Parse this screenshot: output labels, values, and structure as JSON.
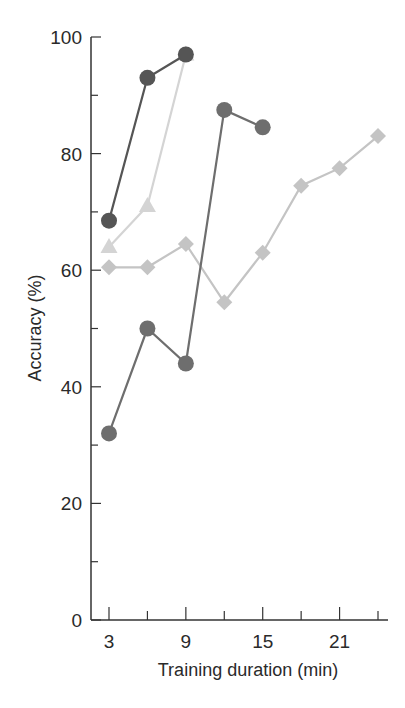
{
  "chart_data": {
    "type": "line",
    "title": "",
    "xlabel": "Training duration (min)",
    "ylabel": "Accuracy (%)",
    "xlim": [
      2,
      25
    ],
    "ylim": [
      0,
      100
    ],
    "x_ticks": [
      3,
      6,
      9,
      12,
      15,
      18,
      21,
      24
    ],
    "x_tick_labels": [
      "3",
      "",
      "9",
      "",
      "15",
      "",
      "21",
      ""
    ],
    "y_ticks": [
      0,
      10,
      20,
      30,
      40,
      50,
      60,
      70,
      80,
      90,
      100
    ],
    "y_tick_labels": [
      "0",
      "",
      "20",
      "",
      "40",
      "",
      "60",
      "",
      "80",
      "",
      "100"
    ],
    "grid": false,
    "legend": null,
    "series": [
      {
        "name": "series-dark-circle",
        "marker": "circle",
        "color": "#555555",
        "x": [
          3,
          6,
          9
        ],
        "values": [
          68.5,
          93,
          97
        ]
      },
      {
        "name": "series-light-triangle",
        "marker": "triangle",
        "color": "#d4d4d4",
        "x": [
          3,
          6,
          9
        ],
        "values": [
          64,
          71,
          97
        ]
      },
      {
        "name": "series-medium-circle",
        "marker": "circle",
        "color": "#6e6e6e",
        "x": [
          3,
          6,
          9,
          12,
          15
        ],
        "values": [
          32,
          50,
          44,
          87.5,
          84.5
        ]
      },
      {
        "name": "series-diamond",
        "marker": "diamond",
        "color": "#c4c4c4",
        "x": [
          3,
          6,
          9,
          12,
          15,
          18,
          21,
          24
        ],
        "values": [
          60.5,
          60.5,
          64.5,
          54.5,
          63,
          74.5,
          77.5,
          83
        ]
      }
    ]
  }
}
